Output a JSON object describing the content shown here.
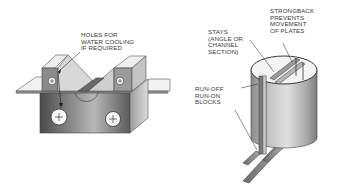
{
  "figures": [
    {
      "id": "cooling-block-fixture",
      "subject": "Copper backing block fixture with water-cooling holes clamping two plates",
      "labels": [
        {
          "key": "holes",
          "lines": [
            "HOLES FOR",
            "WATER COOLING",
            "IF REQUIRED"
          ]
        }
      ]
    },
    {
      "id": "cylinder-fixture",
      "subject": "Rolled cylinder shell held by stays and strongback on support rails",
      "labels": [
        {
          "key": "strongback",
          "lines": [
            "STRONGBACK",
            "PREVENTS",
            "MOVEMENT",
            "OF PLATES"
          ]
        },
        {
          "key": "stays",
          "lines": [
            "STAYS",
            "(ANGLE OR",
            "CHANNEL",
            "SECTION)"
          ]
        },
        {
          "key": "runoff",
          "lines": [
            "RUN-OFF",
            "RUN-ON",
            "BLOCKS"
          ]
        }
      ]
    }
  ],
  "text": {
    "holes_1": "HOLES FOR",
    "holes_2": "WATER COOLING",
    "holes_3": "IF REQUIRED",
    "strongback_1": "STRONGBACK",
    "strongback_2": "PREVENTS",
    "strongback_3": "MOVEMENT",
    "strongback_4": "OF PLATES",
    "stays_1": "STAYS",
    "stays_2": "(ANGLE OR",
    "stays_3": "CHANNEL",
    "stays_4": "SECTION)",
    "runoff_1": "RUN-OFF",
    "runoff_2": "RUN-ON",
    "runoff_3": "BLOCKS"
  },
  "colors": {
    "ink": "#3a3a3a",
    "metal_dark": "#5a5a5a",
    "metal_mid": "#9a9a9a",
    "metal_light": "#e4e4e4",
    "background": "#ffffff"
  }
}
